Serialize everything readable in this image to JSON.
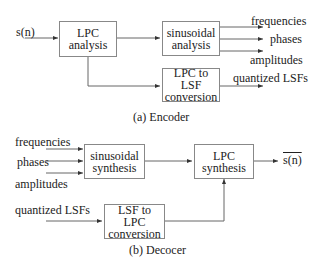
{
  "encoder": {
    "input": "s(n)",
    "boxes": {
      "lpc_analysis": [
        "LPC",
        "analysis"
      ],
      "sinusoidal_analysis": [
        "sinusoidal",
        "analysis"
      ],
      "lpc_to_lsf": [
        "LPC to",
        "LSF",
        "conversion"
      ]
    },
    "outputs": {
      "frequencies": "frequencies",
      "phases": "phases",
      "amplitudes": "amplitudes",
      "quantized_lsfs": "quantized LSFs"
    },
    "caption": "(a) Encoder"
  },
  "decoder": {
    "inputs": {
      "frequencies": "frequencies",
      "phases": "phases",
      "amplitudes": "amplitudes",
      "quantized_lsfs": "quantized LSFs"
    },
    "boxes": {
      "sinusoidal_synthesis": [
        "sinusoidal",
        "synthesis"
      ],
      "lsf_to_lpc": [
        "LSF to",
        "LPC",
        "conversion"
      ],
      "lpc_synthesis": [
        "LPC",
        "synthesis"
      ]
    },
    "output": "s(n)",
    "caption": "(b) Decocer"
  }
}
